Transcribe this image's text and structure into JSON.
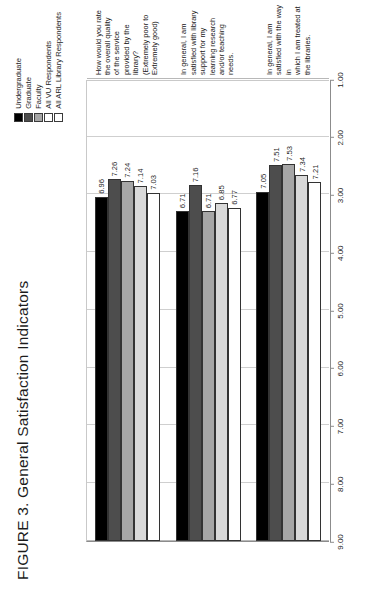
{
  "figure": {
    "title": "FIGURE 3. General Satisfaction Indicators"
  },
  "legend": {
    "items": [
      {
        "label": "Undergraduate",
        "color": "#000000",
        "swatch_name": "legend-swatch-undergraduate"
      },
      {
        "label": "Graduate",
        "color": "#4d4d4d",
        "swatch_name": "legend-swatch-graduate"
      },
      {
        "label": "Faculty",
        "color": "#a6a6a6",
        "swatch_name": "legend-swatch-faculty"
      },
      {
        "label": "All VU Respondents",
        "color": "#ffffff",
        "swatch_name": "legend-swatch-all-vu-respondents"
      },
      {
        "label": "All ARL Library Respondents",
        "color": "#ffffff",
        "swatch_name": "legend-swatch-all-arl-library-respondents"
      }
    ]
  },
  "axis": {
    "ticks": [
      "9.00",
      "8.00",
      "7.00",
      "6.00",
      "5.00",
      "4.00",
      "3.00",
      "2.00",
      "1.00"
    ]
  },
  "categories": [
    {
      "lines": [
        "How would you rate the overall quality",
        "of the service provided by the library?",
        "(Extremely poor to Extremely good)"
      ]
    },
    {
      "lines": [
        "In general, I am satisfied with library",
        "support for my learning research",
        "and/or teaching needs."
      ]
    },
    {
      "lines": [
        "In general, I am satisfied with the way in",
        "which I am treated at the libraries."
      ]
    }
  ],
  "chart_data": {
    "type": "bar",
    "orientation": "horizontal",
    "title": "FIGURE 3. General Satisfaction Indicators",
    "xlabel": "",
    "ylabel": "",
    "xlim": [
      1.0,
      9.0
    ],
    "grid": true,
    "legend_position": "top-right",
    "value_axis_ticks": [
      9.0,
      8.0,
      7.0,
      6.0,
      5.0,
      4.0,
      3.0,
      2.0,
      1.0
    ],
    "value_axis_direction": "right-to-left",
    "categories": [
      "In general, I am satisfied with the way in which I am treated at the libraries.",
      "In general, I am satisfied with library support for my learning research and/or teaching needs.",
      "How would you rate the overall quality of the service provided by the library? (Extremely poor to Extremely good)"
    ],
    "series": [
      {
        "name": "Undergraduate",
        "color": "#000000",
        "values": [
          7.05,
          6.71,
          6.96
        ]
      },
      {
        "name": "Graduate",
        "color": "#4d4d4d",
        "values": [
          7.51,
          7.16,
          7.26
        ]
      },
      {
        "name": "Faculty",
        "color": "#a6a6a6",
        "values": [
          7.53,
          6.71,
          7.24
        ]
      },
      {
        "name": "All VU Respondents",
        "color": "#d9d9d9",
        "values": [
          7.34,
          6.85,
          7.14
        ]
      },
      {
        "name": "All ARL Library Respondents",
        "color": "#ffffff",
        "values": [
          7.21,
          6.77,
          7.03
        ]
      }
    ],
    "data_labels": {
      "In general, I am satisfied with the way in which I am treated at the libraries.": [
        "7.05",
        "7.51",
        "7.53",
        "7.34",
        "7.21"
      ],
      "In general, I am satisfied with library support for my learning research and/or teaching needs.": [
        "6.71",
        "7.16",
        "6.71",
        "6.85",
        "6.77"
      ],
      "How would you rate the overall quality of the service provided by the library? (Extremely poor to Extremely good)": [
        "6.96",
        "7.26",
        "7.24",
        "7.14",
        "7.03"
      ]
    }
  }
}
